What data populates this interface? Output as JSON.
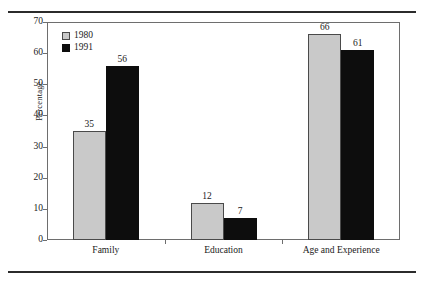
{
  "chart_data": {
    "type": "bar",
    "title": "",
    "subtitle": "",
    "xlabel": "",
    "ylabel": "Percentage",
    "ylim": [
      0,
      70
    ],
    "ytick_labels": [
      "0",
      "10",
      "20",
      "30",
      "40",
      "50",
      "60",
      "70"
    ],
    "ytick_values": [
      0,
      10,
      20,
      30,
      40,
      50,
      60,
      70
    ],
    "grid": false,
    "legend_position": "top-left-inside",
    "categories": [
      "Family",
      "Education",
      "Age and Experience"
    ],
    "series": [
      {
        "name": "1980",
        "color": "#c9c9c9",
        "values": [
          35,
          12,
          66
        ],
        "value_labels": [
          "35",
          "12",
          "66"
        ]
      },
      {
        "name": "1991",
        "color": "#0d0d0d",
        "values": [
          56,
          7,
          61
        ],
        "value_labels": [
          "56",
          "7",
          "61"
        ]
      }
    ]
  },
  "figure": {
    "top_rule": "horizontal-rule",
    "bottom_rule": "horizontal-rule"
  }
}
